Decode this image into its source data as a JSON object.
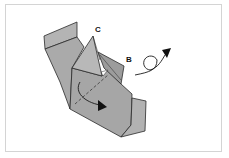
{
  "diagram": {
    "type": "origami-step",
    "labels": {
      "c": "C",
      "b": "B"
    },
    "colors": {
      "paper": "#a9a9a9",
      "paper_light": "#b6b6b6",
      "paper_dark": "#9a9a9a",
      "line": "#2a2a2a",
      "frame": "#d4d4d4"
    },
    "arrows": [
      {
        "name": "turn-over-arrow",
        "meaning": "turn model over"
      },
      {
        "name": "fold-arrow",
        "meaning": "fold flap down"
      }
    ]
  }
}
